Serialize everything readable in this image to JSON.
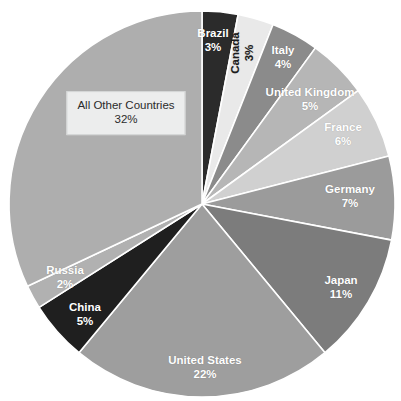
{
  "chart_data": {
    "type": "pie",
    "title": "",
    "subtitle": "",
    "xlabel": "",
    "ylabel": "",
    "legend_position": "none",
    "grid": false,
    "value_unit": "%",
    "start_angle_deg": 0,
    "direction": "clockwise",
    "categories": [
      "Brazil",
      "Canada",
      "Italy",
      "United Kingdom",
      "France",
      "Germany",
      "Japan",
      "United States",
      "China",
      "Russia",
      "All Other Countries"
    ],
    "values": [
      3,
      3,
      4,
      5,
      6,
      7,
      11,
      22,
      5,
      2,
      32
    ],
    "labels": [
      "3%",
      "3%",
      "4%",
      "5%",
      "6%",
      "7%",
      "11%",
      "22%",
      "5%",
      "2%",
      "32%"
    ],
    "colors": [
      "#2b2b2b",
      "#e9e9e9",
      "#8b8b8b",
      "#b6b6b6",
      "#d0d0d0",
      "#9b9b9b",
      "#7c7c7c",
      "#9e9e9e",
      "#1f1f1f",
      "#b1b1b1",
      "#aeaeae"
    ],
    "slices": [
      {
        "name": "Brazil",
        "value": 3,
        "label": "Brazil",
        "pct_label": "3%",
        "color": "#2b2b2b",
        "label_color": "#ffffff",
        "label_x": 213,
        "label_y": 41,
        "rotated": false,
        "callout": false
      },
      {
        "name": "Canada",
        "value": 3,
        "label": "Canada",
        "pct_label": "3%",
        "color": "#e9e9e9",
        "label_color": "#1c1c1c",
        "label_x": 243,
        "label_y": 53,
        "rotated": true,
        "callout": false
      },
      {
        "name": "Italy",
        "value": 4,
        "label": "Italy",
        "pct_label": "4%",
        "color": "#8b8b8b",
        "label_color": "#ffffff",
        "label_x": 283,
        "label_y": 58,
        "rotated": false,
        "callout": false
      },
      {
        "name": "United Kingdom",
        "value": 5,
        "label": "United Kingdom",
        "pct_label": "5%",
        "color": "#b6b6b6",
        "label_color": "#ffffff",
        "label_x": 310,
        "label_y": 100,
        "rotated": false,
        "callout": false
      },
      {
        "name": "France",
        "value": 6,
        "label": "France",
        "pct_label": "6%",
        "color": "#d0d0d0",
        "label_color": "#ffffff",
        "label_x": 343,
        "label_y": 135,
        "rotated": false,
        "callout": false
      },
      {
        "name": "Germany",
        "value": 7,
        "label": "Germany",
        "pct_label": "7%",
        "color": "#9b9b9b",
        "label_color": "#ffffff",
        "label_x": 350,
        "label_y": 197,
        "rotated": false,
        "callout": false
      },
      {
        "name": "Japan",
        "value": 11,
        "label": "Japan",
        "pct_label": "11%",
        "color": "#7c7c7c",
        "label_color": "#ffffff",
        "label_x": 341,
        "label_y": 288,
        "rotated": false,
        "callout": false
      },
      {
        "name": "United States",
        "value": 22,
        "label": "United States",
        "pct_label": "22%",
        "color": "#9e9e9e",
        "label_color": "#ffffff",
        "label_x": 205,
        "label_y": 368,
        "rotated": false,
        "callout": false
      },
      {
        "name": "China",
        "value": 5,
        "label": "China",
        "pct_label": "5%",
        "color": "#1f1f1f",
        "label_color": "#ffffff",
        "label_x": 85,
        "label_y": 315,
        "rotated": false,
        "callout": false
      },
      {
        "name": "Russia",
        "value": 2,
        "label": "Russia",
        "pct_label": "2%",
        "color": "#b1b1b1",
        "label_color": "#ffffff",
        "label_x": 65,
        "label_y": 278,
        "rotated": false,
        "callout": false
      },
      {
        "name": "All Other Countries",
        "value": 32,
        "label": "All Other Countries",
        "pct_label": "32%",
        "color": "#aeaeae",
        "label_color": "#2b2b2b",
        "label_x": 126,
        "label_y": 113,
        "rotated": false,
        "callout": true
      }
    ],
    "geometry": {
      "center_x": 202,
      "center_y": 204,
      "radius": 193
    }
  }
}
